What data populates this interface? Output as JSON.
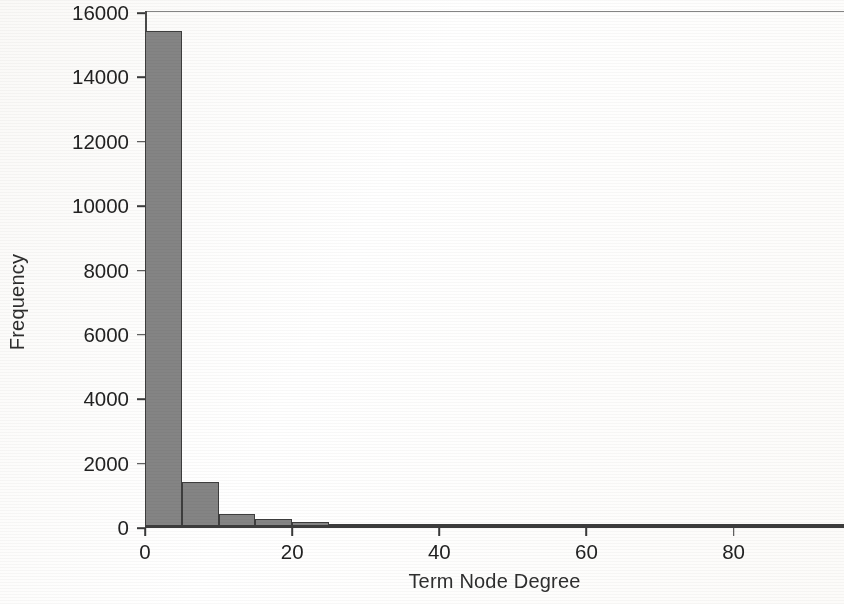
{
  "chart_data": {
    "type": "bar",
    "title": "",
    "subtitle": "",
    "xlabel": "Term Node Degree",
    "ylabel": "Frequency",
    "xlim": [
      0,
      95
    ],
    "ylim": [
      0,
      16000
    ],
    "grid": false,
    "legend": null,
    "bin_width": 5,
    "x_ticks": [
      0,
      20,
      40,
      60,
      80
    ],
    "x_tick_labels": [
      "0",
      "20",
      "40",
      "60",
      "80"
    ],
    "y_ticks": [
      0,
      2000,
      4000,
      6000,
      8000,
      10000,
      12000,
      14000,
      16000
    ],
    "y_tick_labels": [
      "0",
      "2000",
      "4000",
      "6000",
      "8000",
      "10000",
      "12000",
      "14000",
      "16000"
    ],
    "bar_color": "#848484",
    "bar_edge_color": "#3d3d3d",
    "axis_color": "#3c3c3c",
    "text_color": "#222222",
    "background_color": "#ffffff",
    "bins": [
      {
        "start": 0,
        "end": 5,
        "label": "0–5",
        "value": 15400
      },
      {
        "start": 5,
        "end": 10,
        "label": "5–10",
        "value": 1380
      },
      {
        "start": 10,
        "end": 15,
        "label": "10–15",
        "value": 380
      },
      {
        "start": 15,
        "end": 20,
        "label": "15–20",
        "value": 235
      },
      {
        "start": 20,
        "end": 25,
        "label": "20–25",
        "value": 140
      },
      {
        "start": 25,
        "end": 30,
        "label": "25–30",
        "value": 85
      },
      {
        "start": 30,
        "end": 35,
        "label": "30–35",
        "value": 70
      },
      {
        "start": 35,
        "end": 40,
        "label": "35–40",
        "value": 60
      },
      {
        "start": 40,
        "end": 45,
        "label": "40–45",
        "value": 40
      },
      {
        "start": 45,
        "end": 50,
        "label": "45–50",
        "value": 35
      },
      {
        "start": 50,
        "end": 55,
        "label": "50–55",
        "value": 22
      },
      {
        "start": 55,
        "end": 60,
        "label": "55–60",
        "value": 10
      },
      {
        "start": 60,
        "end": 65,
        "label": "60–65",
        "value": 8
      },
      {
        "start": 65,
        "end": 70,
        "label": "65–70",
        "value": 6
      },
      {
        "start": 70,
        "end": 75,
        "label": "70–75",
        "value": 5
      },
      {
        "start": 75,
        "end": 80,
        "label": "75–80",
        "value": 4
      },
      {
        "start": 80,
        "end": 85,
        "label": "80–85",
        "value": 3
      },
      {
        "start": 85,
        "end": 90,
        "label": "85–90",
        "value": 2
      },
      {
        "start": 90,
        "end": 95,
        "label": "90–95",
        "value": 2
      }
    ],
    "categories": [
      "0–5",
      "5–10",
      "10–15",
      "15–20",
      "20–25",
      "25–30",
      "30–35",
      "35–40",
      "40–45",
      "45–50",
      "50–55",
      "55–60",
      "60–65",
      "65–70",
      "70–75",
      "75–80",
      "80–85",
      "85–90",
      "90–95"
    ],
    "values": [
      15400,
      1380,
      380,
      235,
      140,
      85,
      70,
      60,
      40,
      35,
      22,
      10,
      8,
      6,
      5,
      4,
      3,
      2,
      2
    ]
  }
}
